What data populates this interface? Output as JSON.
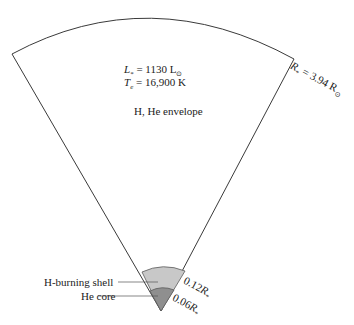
{
  "diagram": {
    "parameters": {
      "luminosity_symbol": "L",
      "luminosity_sub": "*",
      "luminosity_value": " = 1130 L",
      "luminosity_unit_sub": "⊙",
      "temperature_symbol": "T",
      "temperature_sub": "e",
      "temperature_value": " = 16,900 K"
    },
    "envelope_label": "H, He envelope",
    "radius_label": {
      "symbol": "R",
      "sub": "*",
      "value": " = 3.94 R",
      "unit_sub": "⊙"
    },
    "shell_label": "H-burning shell",
    "core_label": "He core",
    "shell_radius": {
      "value": "0.12",
      "symbol": "R",
      "sub": "*"
    },
    "core_radius": {
      "value": "0.06",
      "symbol": "R",
      "sub": "*"
    },
    "colors": {
      "outline": "#3a3a3a",
      "shell_fill": "#c8c8c8",
      "core_fill": "#8f8f8f",
      "background": "#ffffff"
    }
  }
}
